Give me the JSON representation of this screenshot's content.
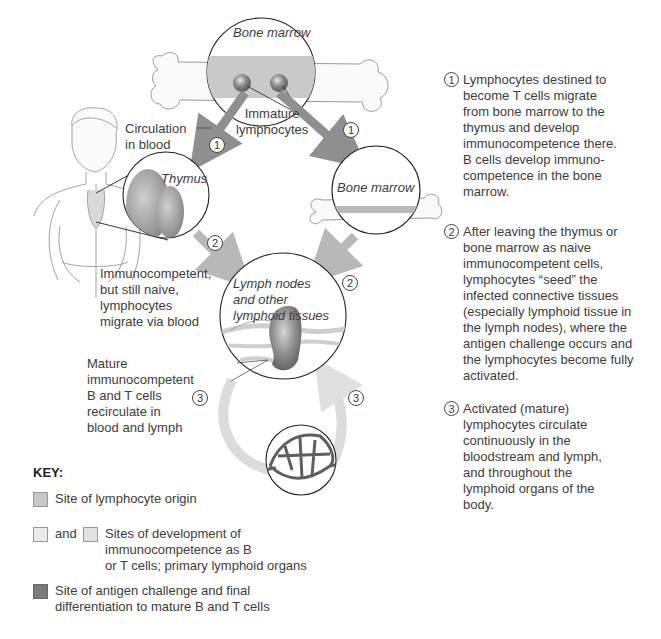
{
  "diagram": {
    "labels": {
      "bone_marrow_top": "Bone marrow",
      "immature_lymphocytes": "Immature\nlymphocytes",
      "circulation_in_blood": "Circulation\nin blood",
      "thymus": "Thymus",
      "bone_marrow_right": "Bone marrow",
      "lymph_nodes": "Lymph nodes\nand other\nlymphoid tissues",
      "immunocompetent_naive": "Immunocompetent,\nbut still naive,\nlymphocytes\nmigrate via blood",
      "mature_cells": "Mature\nimmunocompetent\nB and T cells\nrecirculate in\nblood and lymph"
    },
    "badges": {
      "one": "1",
      "two": "2",
      "three": "3"
    },
    "colors": {
      "origin": "#c8c8c8",
      "primary": "#e6e6e6",
      "antigen": "#7a7a7a",
      "arrow_dark": "#8f8f8f",
      "arrow_mid": "#b8b8b8",
      "arrow_light": "#dcdcdc"
    }
  },
  "steps": [
    {
      "num": "1",
      "text": "Lymphocytes destined to\nbecome T cells migrate\nfrom bone marrow to the\nthymus and develop\nimmunocompetence there.\nB cells develop immuno-\ncompetence in the bone\nmarrow."
    },
    {
      "num": "2",
      "text": "After leaving the thymus or\nbone marrow as naive\nimmunocompetent cells,\nlymphocytes “seed” the\ninfected connective tissues\n(especially lymphoid tissue in\nthe lymph nodes), where the\nantigen challenge occurs and\nthe lymphocytes become fully\nactivated."
    },
    {
      "num": "3",
      "text": "Activated (mature)\nlymphocytes circulate\ncontinuously in the\nbloodstream and lymph,\nand throughout the\nlymphoid organs of the\nbody."
    }
  ],
  "key": {
    "title": "KEY:",
    "items": [
      {
        "text": "Site of lymphocyte origin"
      },
      {
        "and": "and",
        "text": "Sites of development of\n immunocompetence as B\nor T cells; primary lymphoid organs"
      },
      {
        "text": "Site of antigen challenge and final\ndifferentiation to mature B and T cells"
      }
    ]
  }
}
